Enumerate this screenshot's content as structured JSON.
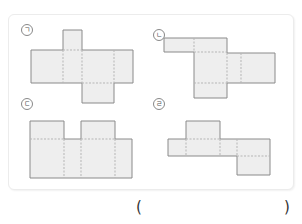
{
  "problem": {
    "options": [
      {
        "id": "a",
        "label": "ㄱ"
      },
      {
        "id": "b",
        "label": "ㄴ"
      },
      {
        "id": "c",
        "label": "ㄷ"
      },
      {
        "id": "d",
        "label": "ㄹ"
      }
    ],
    "answer": {
      "open": "(",
      "close": ")",
      "value": ""
    }
  },
  "colors": {
    "face_fill": "#eeeeee",
    "outline": "#8a8a8a",
    "fold_line": "#b5b5b5"
  }
}
